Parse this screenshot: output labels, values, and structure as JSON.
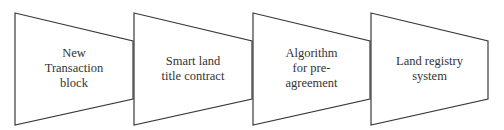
{
  "diagram": {
    "type": "process-flow",
    "stroke_color": "#3a3a3a",
    "fill_color": "#ffffff",
    "text_color": "#333333",
    "steps": [
      {
        "id": "step-1",
        "lines": [
          "New",
          "Transaction",
          "block"
        ]
      },
      {
        "id": "step-2",
        "lines": [
          "Smart land",
          "title contract"
        ]
      },
      {
        "id": "step-3",
        "lines": [
          "Algorithm",
          "for pre-",
          "agreement"
        ]
      },
      {
        "id": "step-4",
        "lines": [
          "Land registry",
          "system"
        ]
      }
    ]
  }
}
